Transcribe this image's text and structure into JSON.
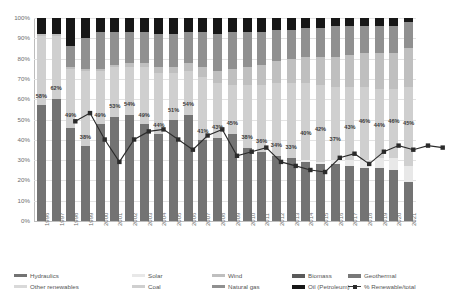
{
  "chart_data": {
    "type": "bar",
    "subtype": "stacked-bar-with-line",
    "title": "",
    "xlabel": "",
    "ylabel": "",
    "ylim": [
      0,
      100
    ],
    "ytick_labels": [
      "100%",
      "90%",
      "80%",
      "70%",
      "60%",
      "50%",
      "40%",
      "30%",
      "20%",
      "10%",
      "0%"
    ],
    "ytick_values": [
      100,
      90,
      80,
      70,
      60,
      50,
      40,
      30,
      20,
      10,
      0
    ],
    "grid": true,
    "legend_position": "bottom",
    "categories": [
      "1996",
      "1997",
      "1998",
      "1999",
      "2000",
      "2001",
      "2002",
      "2003",
      "2004",
      "2005",
      "2006",
      "2007",
      "2008",
      "2009",
      "2010",
      "2011",
      "2012",
      "2013",
      "2014",
      "2015",
      "2016",
      "2017",
      "2018",
      "2019",
      "2020",
      "2021"
    ],
    "series": [
      {
        "name": "Hydraulics",
        "color": "#737373",
        "values": [
          57,
          60,
          46,
          37,
          48,
          51,
          52,
          48,
          43,
          50,
          52,
          40,
          41,
          43,
          36,
          34,
          32,
          31,
          29,
          28,
          28,
          27,
          26,
          26,
          25,
          19
        ]
      },
      {
        "name": "Other renewables",
        "color": "#d9d9d9",
        "values": [
          0,
          0,
          0,
          0,
          0,
          0,
          0,
          0,
          0,
          0,
          0,
          0,
          0,
          0,
          0,
          0,
          0,
          0,
          0,
          0,
          0,
          0,
          0,
          0,
          0,
          0
        ]
      },
      {
        "name": "Solar",
        "color": "#e8e8e8",
        "values": [
          0,
          0,
          0,
          0,
          0,
          0,
          0,
          0,
          0,
          0,
          0,
          0,
          0,
          0,
          0,
          0,
          0,
          0,
          1,
          1,
          2,
          3,
          4,
          5,
          6,
          8
        ]
      },
      {
        "name": "Coal",
        "color": "#cfcfcf",
        "values": [
          34,
          31,
          29,
          37,
          26,
          25,
          24,
          28,
          30,
          23,
          22,
          31,
          27,
          24,
          31,
          33,
          36,
          37,
          38,
          38,
          36,
          36,
          36,
          34,
          34,
          39
        ]
      },
      {
        "name": "Wind",
        "color": "#bfbfbf",
        "values": [
          1,
          1,
          1,
          1,
          1,
          1,
          2,
          2,
          3,
          3,
          4,
          5,
          6,
          8,
          9,
          10,
          11,
          12,
          13,
          14,
          15,
          16,
          17,
          18,
          18,
          19
        ]
      },
      {
        "name": "Natural gas",
        "color": "#909090",
        "values": [
          0,
          0,
          10,
          15,
          18,
          16,
          15,
          15,
          16,
          16,
          15,
          17,
          18,
          18,
          17,
          16,
          15,
          14,
          14,
          14,
          15,
          14,
          13,
          13,
          13,
          13
        ]
      },
      {
        "name": "Biomass",
        "color": "#5a5a5a",
        "values": [
          0,
          0,
          0,
          0,
          0,
          0,
          0,
          0,
          0,
          0,
          0,
          0,
          0,
          0,
          0,
          0,
          0,
          0,
          0,
          0,
          0,
          0,
          0,
          0,
          0,
          0
        ]
      },
      {
        "name": "Oil (Petroleum)",
        "color": "#171717",
        "values": [
          8,
          8,
          14,
          10,
          7,
          7,
          7,
          7,
          8,
          8,
          7,
          7,
          8,
          7,
          7,
          7,
          6,
          6,
          5,
          5,
          4,
          4,
          4,
          4,
          4,
          2
        ]
      },
      {
        "name": "Geothermal",
        "color": "#787878",
        "values": [
          0,
          0,
          0,
          0,
          0,
          0,
          0,
          0,
          0,
          0,
          0,
          0,
          0,
          0,
          0,
          0,
          0,
          0,
          0,
          0,
          0,
          0,
          0,
          0,
          0,
          0
        ]
      }
    ],
    "line_series": {
      "name": "% Renewable/total",
      "color": "#2b2b2b",
      "marker": "square",
      "values": [
        58,
        62,
        49,
        38,
        49,
        53,
        54,
        49,
        44,
        51,
        54,
        41,
        43,
        45,
        38,
        36,
        34,
        33,
        40,
        42,
        37,
        43,
        46,
        44,
        46,
        45
      ],
      "labels": [
        "58%",
        "62%",
        "49%",
        "38%",
        "49%",
        "53%",
        "54%",
        "49%",
        "44%",
        "51%",
        "54%",
        "41%",
        "43%",
        "45%",
        "38%",
        "36%",
        "34%",
        "33%",
        "40%",
        "42%",
        "37%",
        "43%",
        "46%",
        "44%",
        "46%",
        "45%"
      ]
    }
  },
  "legend": {
    "items": [
      {
        "label": "Hydraulics",
        "color": "#737373",
        "type": "swatch",
        "col": 0,
        "row": 0
      },
      {
        "label": "Other renewables",
        "color": "#d9d9d9",
        "type": "swatch",
        "col": 0,
        "row": 1
      },
      {
        "label": "Solar",
        "color": "#e8e8e8",
        "type": "swatch",
        "col": 1,
        "row": 0
      },
      {
        "label": "Coal",
        "color": "#cfcfcf",
        "type": "swatch",
        "col": 1,
        "row": 1
      },
      {
        "label": "Wind",
        "color": "#bfbfbf",
        "type": "swatch",
        "col": 2,
        "row": 0
      },
      {
        "label": "Natural gas",
        "color": "#909090",
        "type": "swatch",
        "col": 2,
        "row": 1
      },
      {
        "label": "Biomass",
        "color": "#5a5a5a",
        "type": "swatch",
        "col": 3,
        "row": 0
      },
      {
        "label": "Oil (Petroleum)",
        "color": "#171717",
        "type": "swatch",
        "col": 3,
        "row": 1
      },
      {
        "label": "Geothermal",
        "color": "#787878",
        "type": "swatch",
        "col": 4,
        "row": 0
      },
      {
        "label": "% Renewable/total",
        "color": "#2b2b2b",
        "type": "marker",
        "col": 4,
        "row": 1
      }
    ]
  }
}
